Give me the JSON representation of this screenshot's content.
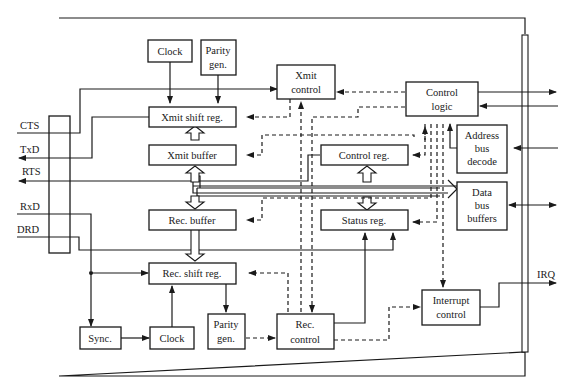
{
  "diagram": {
    "type": "block-diagram",
    "blocks": [
      {
        "id": "clock_tx",
        "label": [
          "Clock"
        ]
      },
      {
        "id": "parity_tx",
        "label": [
          "Parity",
          "gen."
        ]
      },
      {
        "id": "xmit_control",
        "label": [
          "Xmit",
          "control"
        ]
      },
      {
        "id": "control_logic",
        "label": [
          "Control",
          "logic"
        ]
      },
      {
        "id": "xmit_shift",
        "label": [
          "Xmit shift reg."
        ]
      },
      {
        "id": "xmit_buffer",
        "label": [
          "Xmit buffer"
        ]
      },
      {
        "id": "control_reg",
        "label": [
          "Control reg."
        ]
      },
      {
        "id": "address_decode",
        "label": [
          "Address",
          "bus",
          "decode"
        ]
      },
      {
        "id": "data_bus_buffers",
        "label": [
          "Data",
          "bus",
          "buffers"
        ]
      },
      {
        "id": "rec_buffer",
        "label": [
          "Rec. buffer"
        ]
      },
      {
        "id": "status_reg",
        "label": [
          "Status reg."
        ]
      },
      {
        "id": "rec_shift",
        "label": [
          "Rec. shift reg."
        ]
      },
      {
        "id": "sync",
        "label": [
          "Sync."
        ]
      },
      {
        "id": "clock_rx",
        "label": [
          "Clock"
        ]
      },
      {
        "id": "parity_rx",
        "label": [
          "Parity",
          "gen."
        ]
      },
      {
        "id": "rec_control",
        "label": [
          "Rec.",
          "control"
        ]
      },
      {
        "id": "interrupt_control",
        "label": [
          "Interrupt",
          "control"
        ]
      }
    ],
    "signals_left": [
      "CTS",
      "TxD",
      "RTS",
      "RxD",
      "DRD"
    ],
    "signals_right": [
      "IRQ"
    ],
    "edges": [
      {
        "from": "clock_tx",
        "to": "xmit_shift",
        "style": "solid"
      },
      {
        "from": "parity_tx",
        "to": "xmit_shift",
        "style": "solid"
      },
      {
        "from": "CTS",
        "to": "xmit_control",
        "style": "solid"
      },
      {
        "from": "xmit_shift",
        "to": "TxD",
        "style": "solid"
      },
      {
        "from": "control_reg",
        "to": "RTS",
        "style": "solid"
      },
      {
        "from": "xmit_buffer",
        "to": "xmit_shift",
        "style": "bus"
      },
      {
        "from": "data_bus",
        "to": "xmit_buffer",
        "style": "bus"
      },
      {
        "from": "data_bus",
        "to": "rec_buffer",
        "style": "bus"
      },
      {
        "from": "rec_buffer",
        "to": "rec_shift",
        "style": "bus"
      },
      {
        "from": "data_bus",
        "to": "control_reg",
        "style": "bus"
      },
      {
        "from": "data_bus",
        "to": "status_reg",
        "style": "bus"
      },
      {
        "from": "data_bus",
        "to": "data_bus_buffers",
        "style": "bus"
      },
      {
        "from": "control_logic",
        "to": "xmit_control",
        "style": "dashed"
      },
      {
        "from": "xmit_control",
        "to": "xmit_shift",
        "style": "dashed"
      },
      {
        "from": "control_logic",
        "to": "xmit_buffer",
        "style": "dashed"
      },
      {
        "from": "control_logic",
        "to": "control_reg",
        "style": "dashed"
      },
      {
        "from": "control_logic",
        "to": "rec_buffer",
        "style": "dashed"
      },
      {
        "from": "control_logic",
        "to": "status_reg",
        "style": "dashed"
      },
      {
        "from": "control_logic",
        "to": "interrupt_control",
        "style": "dashed"
      },
      {
        "from": "rec_control",
        "to": "xmit_control",
        "style": "dashed"
      },
      {
        "from": "control_logic",
        "to": "rec_control",
        "style": "dashed"
      },
      {
        "from": "rec_control",
        "to": "rec_shift",
        "style": "dashed"
      },
      {
        "from": "parity_rx",
        "to": "rec_control",
        "style": "dashed"
      },
      {
        "from": "rec_control",
        "to": "interrupt_control",
        "style": "dashed"
      },
      {
        "from": "rec_control",
        "to": "status_reg",
        "style": "solid"
      },
      {
        "from": "DRD",
        "to": "status_reg",
        "style": "solid"
      },
      {
        "from": "RxD",
        "to": "rec_shift",
        "style": "solid"
      },
      {
        "from": "RxD",
        "to": "sync",
        "style": "solid"
      },
      {
        "from": "sync",
        "to": "clock_rx",
        "style": "solid"
      },
      {
        "from": "clock_rx",
        "to": "rec_shift",
        "style": "solid"
      },
      {
        "from": "rec_shift",
        "to": "parity_rx",
        "style": "solid"
      },
      {
        "from": "address_decode",
        "to": "control_logic",
        "style": "solid"
      },
      {
        "from": "interrupt_control",
        "to": "IRQ",
        "style": "solid"
      },
      {
        "from": "control_logic",
        "to": "system_bus",
        "style": "solid"
      },
      {
        "from": "system_bus",
        "to": "control_logic",
        "style": "solid"
      },
      {
        "from": "system_bus",
        "to": "address_decode",
        "style": "solid"
      },
      {
        "from": "data_bus_buffers",
        "to": "system_bus",
        "style": "bidirectional"
      }
    ]
  },
  "labels": {
    "cts": "CTS",
    "txd": "TxD",
    "rts": "RTS",
    "rxd": "RxD",
    "drd": "DRD",
    "irq": "IRQ",
    "clock_tx": "Clock",
    "parity_tx_1": "Parity",
    "parity_tx_2": "gen.",
    "xmit_control_1": "Xmit",
    "xmit_control_2": "control",
    "control_logic_1": "Control",
    "control_logic_2": "logic",
    "xmit_shift": "Xmit shift reg.",
    "xmit_buffer": "Xmit buffer",
    "control_reg": "Control reg.",
    "address_1": "Address",
    "address_2": "bus",
    "address_3": "decode",
    "data_1": "Data",
    "data_2": "bus",
    "data_3": "buffers",
    "rec_buffer": "Rec. buffer",
    "status_reg": "Status reg.",
    "rec_shift": "Rec. shift reg.",
    "sync": "Sync.",
    "clock_rx": "Clock",
    "parity_rx_1": "Parity",
    "parity_rx_2": "gen.",
    "rec_control_1": "Rec.",
    "rec_control_2": "control",
    "interrupt_1": "Interrupt",
    "interrupt_2": "control"
  }
}
